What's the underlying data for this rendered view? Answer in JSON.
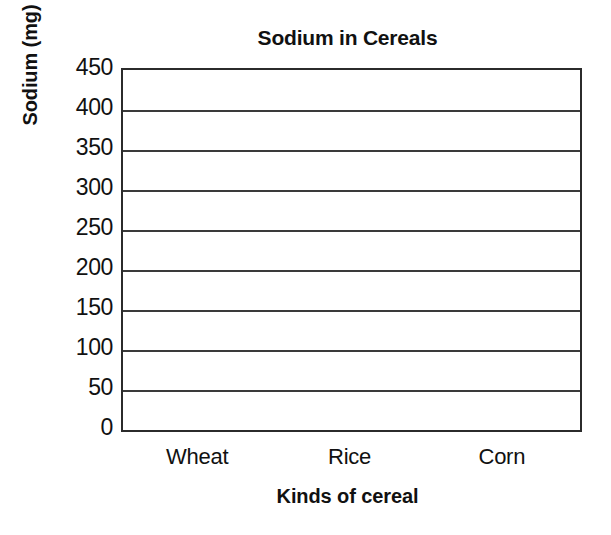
{
  "chart_data": {
    "type": "bar",
    "title": "Sodium in Cereals",
    "subtitle": "",
    "xlabel": "Kinds of cereal",
    "ylabel": "Sodium (mg)",
    "categories": [
      "Wheat",
      "Rice",
      "Corn"
    ],
    "values": [
      null,
      null,
      null
    ],
    "series": [
      {
        "name": "Sodium (mg)",
        "values": [
          null,
          null,
          null
        ]
      }
    ],
    "ylim": [
      0,
      450
    ],
    "yticks": [
      0,
      50,
      100,
      150,
      200,
      250,
      300,
      350,
      400,
      450
    ],
    "ytick_labels": [
      "0",
      "50",
      "100",
      "150",
      "200",
      "250",
      "300",
      "350",
      "400",
      "450"
    ],
    "ytick_interval": 50,
    "xtick_labels": [
      "Wheat",
      "Rice",
      "Corn"
    ],
    "grid": "horizontal",
    "grid_on": true,
    "legend": "none",
    "legend_position": "none",
    "annotations": [],
    "note": "Blank grid template: axes and gridlines are drawn but no bars are plotted.",
    "colors": {
      "background": "#ffffff",
      "plot_background": "#ffffff",
      "axis_line": "#2b2b2b",
      "gridline": "#3a3a3a",
      "text": "#111111"
    }
  }
}
